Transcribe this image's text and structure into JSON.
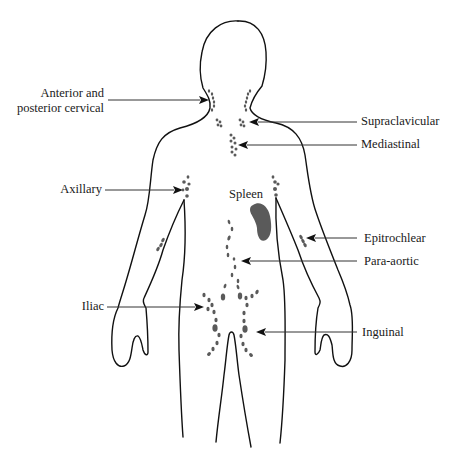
{
  "diagram": {
    "colors": {
      "outline": "#111111",
      "lymph_node": "#5a5a5a",
      "spleen": "#5a5a5a",
      "pointer_line": "#333333",
      "background": "#ffffff"
    },
    "labels": {
      "cervical_line1": "Anterior and",
      "cervical_line2": "posterior cervical",
      "supraclavicular": "Supraclavicular",
      "mediastinal": "Mediastinal",
      "axillary": "Axillary",
      "spleen": "Spleen",
      "epitrochlear": "Epitrochlear",
      "para_aortic": "Para-aortic",
      "iliac": "Iliac",
      "inguinal": "Inguinal"
    }
  }
}
